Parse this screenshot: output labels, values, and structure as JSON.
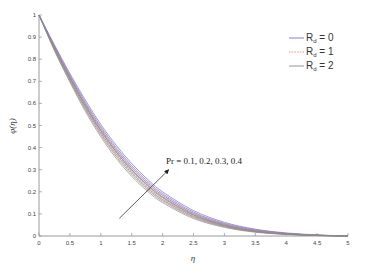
{
  "chart_data": {
    "type": "line",
    "title": "",
    "xlabel": "η",
    "ylabel": "φ(η)",
    "xlim": [
      0,
      5
    ],
    "ylim": [
      0,
      1
    ],
    "grid": false,
    "legend_position": "upper right",
    "x_ticks": [
      "0",
      "0.5",
      "1",
      "1.5",
      "2",
      "2.5",
      "3",
      "3.5",
      "4",
      "4.5",
      "5"
    ],
    "y_ticks": [
      "0",
      "0.1",
      "0.2",
      "0.3",
      "0.4",
      "0.5",
      "0.6",
      "0.7",
      "0.8",
      "0.9",
      "1"
    ],
    "x": [
      0,
      0.25,
      0.5,
      0.75,
      1,
      1.25,
      1.5,
      1.75,
      2,
      2.5,
      3,
      3.5,
      4,
      4.5,
      5
    ],
    "annotation": {
      "text": "Pr = 0.1, 0.2, 0.3, 0.4",
      "arrow": {
        "from": [
          1.3,
          0.08
        ],
        "to": [
          2.1,
          0.3
        ]
      }
    },
    "series": [
      {
        "name": "R_d = 0",
        "legend_label": "R",
        "legend_sub": "d",
        "legend_value": " = 0",
        "color": "#6f6fc8",
        "dash": "",
        "curves": [
          {
            "Pr": 0.1,
            "values": [
              1,
              0.865,
              0.735,
              0.615,
              0.505,
              0.41,
              0.328,
              0.258,
              0.2,
              0.115,
              0.062,
              0.031,
              0.014,
              0.005,
              0
            ]
          },
          {
            "Pr": 0.2,
            "values": [
              1,
              0.86,
              0.728,
              0.605,
              0.495,
              0.4,
              0.318,
              0.249,
              0.192,
              0.108,
              0.057,
              0.028,
              0.012,
              0.004,
              0
            ]
          },
          {
            "Pr": 0.3,
            "values": [
              1,
              0.856,
              0.722,
              0.597,
              0.486,
              0.39,
              0.308,
              0.24,
              0.184,
              0.102,
              0.053,
              0.025,
              0.011,
              0.004,
              0
            ]
          },
          {
            "Pr": 0.4,
            "values": [
              1,
              0.852,
              0.716,
              0.589,
              0.477,
              0.381,
              0.3,
              0.232,
              0.177,
              0.097,
              0.05,
              0.023,
              0.01,
              0.003,
              0
            ]
          }
        ]
      },
      {
        "name": "R_d = 1",
        "legend_label": "R",
        "legend_sub": "d",
        "legend_value": " = 1",
        "color": "#e08a6a",
        "dash": "1.5,1.2",
        "curves": [
          {
            "Pr": 0.1,
            "values": [
              1,
              0.858,
              0.725,
              0.602,
              0.491,
              0.395,
              0.312,
              0.243,
              0.186,
              0.104,
              0.054,
              0.026,
              0.011,
              0.004,
              0
            ]
          },
          {
            "Pr": 0.2,
            "values": [
              1,
              0.853,
              0.718,
              0.593,
              0.481,
              0.385,
              0.302,
              0.234,
              0.178,
              0.098,
              0.05,
              0.024,
              0.01,
              0.003,
              0
            ]
          },
          {
            "Pr": 0.3,
            "values": [
              1,
              0.849,
              0.712,
              0.585,
              0.472,
              0.375,
              0.293,
              0.225,
              0.17,
              0.093,
              0.047,
              0.022,
              0.009,
              0.003,
              0
            ]
          },
          {
            "Pr": 0.4,
            "values": [
              1,
              0.845,
              0.706,
              0.577,
              0.463,
              0.366,
              0.284,
              0.217,
              0.163,
              0.088,
              0.044,
              0.02,
              0.008,
              0.003,
              0
            ]
          }
        ]
      },
      {
        "name": "R_d = 2",
        "legend_label": "R",
        "legend_sub": "d",
        "legend_value": " = 2",
        "color": "#8a8a8a",
        "dash": "",
        "curves": [
          {
            "Pr": 0.1,
            "values": [
              1,
              0.851,
              0.715,
              0.589,
              0.477,
              0.38,
              0.297,
              0.229,
              0.173,
              0.094,
              0.048,
              0.022,
              0.009,
              0.003,
              0
            ]
          },
          {
            "Pr": 0.2,
            "values": [
              1,
              0.846,
              0.708,
              0.58,
              0.467,
              0.37,
              0.288,
              0.22,
              0.165,
              0.089,
              0.045,
              0.02,
              0.008,
              0.003,
              0
            ]
          },
          {
            "Pr": 0.3,
            "values": [
              1,
              0.842,
              0.702,
              0.572,
              0.458,
              0.36,
              0.279,
              0.212,
              0.158,
              0.084,
              0.042,
              0.019,
              0.008,
              0.002,
              0
            ]
          },
          {
            "Pr": 0.4,
            "values": [
              1,
              0.838,
              0.696,
              0.564,
              0.449,
              0.351,
              0.27,
              0.204,
              0.151,
              0.079,
              0.039,
              0.017,
              0.007,
              0.002,
              0
            ]
          }
        ]
      }
    ]
  }
}
